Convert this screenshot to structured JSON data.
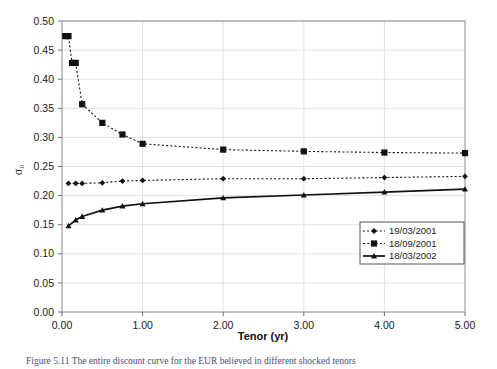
{
  "chart_data": {
    "type": "line",
    "title": "",
    "xlabel": "Tenor (yr)",
    "ylabel": "σ₀",
    "xlim": [
      0.0,
      5.0
    ],
    "ylim": [
      0.0,
      0.5
    ],
    "xticks": [
      "0.00",
      "1.00",
      "2.00",
      "3.00",
      "4.00",
      "5.00"
    ],
    "xtick_values": [
      0.0,
      1.0,
      2.0,
      3.0,
      4.0,
      5.0
    ],
    "yticks": [
      "0.00",
      "0.05",
      "0.10",
      "0.15",
      "0.20",
      "0.25",
      "0.30",
      "0.35",
      "0.40",
      "0.45",
      "0.50"
    ],
    "ytick_values": [
      0.0,
      0.05,
      0.1,
      0.15,
      0.2,
      0.25,
      0.3,
      0.35,
      0.4,
      0.45,
      0.5
    ],
    "grid": true,
    "legend_position": "right-middle",
    "series": [
      {
        "name": "19/03/2001",
        "marker": "diamond",
        "linestyle": "dotted",
        "color": "#111111",
        "x": [
          0.08,
          0.17,
          0.25,
          0.5,
          0.75,
          1.0,
          2.0,
          3.0,
          4.0,
          5.0
        ],
        "y": [
          0.221,
          0.221,
          0.221,
          0.222,
          0.225,
          0.226,
          0.229,
          0.229,
          0.231,
          0.233
        ]
      },
      {
        "name": "18/09/2001",
        "marker": "square",
        "linestyle": "dotted",
        "color": "#111111",
        "x": [
          0.08,
          0.17,
          0.25,
          0.5,
          0.75,
          1.0,
          2.0,
          3.0,
          4.0,
          5.0
        ],
        "y": [
          0.474,
          0.428,
          0.357,
          0.325,
          0.305,
          0.289,
          0.279,
          0.276,
          0.274,
          0.273
        ],
        "x_extra": [
          0.04,
          0.125
        ],
        "y_extra": [
          0.474,
          0.428
        ]
      },
      {
        "name": "18/03/2002",
        "marker": "triangle",
        "linestyle": "solid",
        "color": "#111111",
        "x": [
          0.08,
          0.17,
          0.25,
          0.5,
          0.75,
          1.0,
          2.0,
          3.0,
          4.0,
          5.0
        ],
        "y": [
          0.148,
          0.158,
          0.164,
          0.175,
          0.182,
          0.186,
          0.196,
          0.201,
          0.206,
          0.211
        ]
      }
    ]
  },
  "legend": {
    "entries": [
      {
        "label": "19/03/2001",
        "marker": "diamond",
        "style": "dotted"
      },
      {
        "label": "18/09/2001",
        "marker": "square",
        "style": "dotted"
      },
      {
        "label": "18/03/2002",
        "marker": "triangle",
        "style": "solid"
      }
    ]
  },
  "caption": {
    "text": "Figure 5.11  The entire discount curve for the EUR believed in different shocked tenors"
  },
  "colors": {
    "series": "#111111",
    "grid": "#d9d9d9",
    "frame": "#8a8a8a",
    "caption": "#3f4f7a"
  }
}
